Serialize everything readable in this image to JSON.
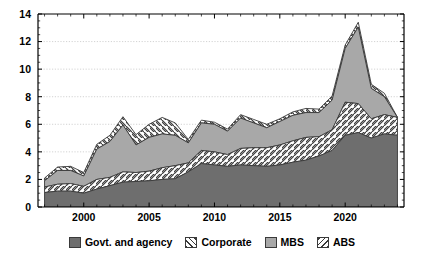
{
  "chart_data": {
    "type": "area",
    "stacked": true,
    "title": "",
    "subtitle": "",
    "xlabel": "",
    "ylabel": "",
    "xlim": [
      1996.5,
      2024.5
    ],
    "ylim": [
      0,
      14
    ],
    "yticks": [
      0,
      2,
      4,
      6,
      8,
      10,
      12,
      14
    ],
    "ytick_labels": [
      "0",
      "2",
      "4",
      "6",
      "8",
      "10",
      "12",
      "14"
    ],
    "xticks": [
      2000,
      2005,
      2010,
      2015,
      2020
    ],
    "xtick_labels": [
      "2000",
      "2005",
      "2010",
      "2015",
      "2020"
    ],
    "minor_xtick_interval": 1,
    "grid": "horizontal-dotted",
    "legend_position": "bottom-center",
    "x": [
      1997,
      1998,
      1999,
      2000,
      2001,
      2002,
      2003,
      2004,
      2005,
      2006,
      2007,
      2008,
      2009,
      2010,
      2011,
      2012,
      2013,
      2014,
      2015,
      2016,
      2017,
      2018,
      2019,
      2020,
      2021,
      2022,
      2023,
      2024
    ],
    "series": [
      {
        "name": "Govt. and agency",
        "key": "govt",
        "color": "#6e6e6e",
        "pattern": "solid",
        "values": [
          1.05,
          1.15,
          1.15,
          1.0,
          1.3,
          1.55,
          1.8,
          1.85,
          1.9,
          2.0,
          2.05,
          2.55,
          3.15,
          3.05,
          2.95,
          3.05,
          3.0,
          2.95,
          3.05,
          3.25,
          3.4,
          3.7,
          4.1,
          5.2,
          5.4,
          5.0,
          5.3,
          5.2
        ]
      },
      {
        "name": "Corporate",
        "key": "corporate",
        "color": "#ffffff",
        "pattern": "hatch-forward",
        "values": [
          0.4,
          0.5,
          0.55,
          0.5,
          0.7,
          0.6,
          0.75,
          0.65,
          0.7,
          0.85,
          0.95,
          0.65,
          0.95,
          0.95,
          0.85,
          1.2,
          1.3,
          1.35,
          1.45,
          1.55,
          1.65,
          1.4,
          1.5,
          2.4,
          2.1,
          1.4,
          1.4,
          1.3
        ]
      },
      {
        "name": "MBS",
        "key": "mbs",
        "color": "#a8a8a8",
        "pattern": "solid",
        "values": [
          0.45,
          1.0,
          0.95,
          0.75,
          2.2,
          2.6,
          3.4,
          2.0,
          2.45,
          2.45,
          2.2,
          1.45,
          2.0,
          2.0,
          1.7,
          2.2,
          1.8,
          1.45,
          1.7,
          1.85,
          1.8,
          1.75,
          2.15,
          3.9,
          5.55,
          2.2,
          1.3,
          0.0
        ]
      },
      {
        "name": "ABS",
        "key": "abs",
        "color": "#ffffff",
        "pattern": "hatch-back",
        "values": [
          0.2,
          0.25,
          0.3,
          0.25,
          0.35,
          0.45,
          0.6,
          0.75,
          0.95,
          1.2,
          0.9,
          0.25,
          0.2,
          0.15,
          0.15,
          0.25,
          0.25,
          0.25,
          0.2,
          0.25,
          0.3,
          0.25,
          0.3,
          0.25,
          0.35,
          0.3,
          0.25,
          0.0
        ]
      }
    ]
  },
  "legend": {
    "items": [
      {
        "label": "Govt. and agency",
        "color": "#6e6e6e",
        "pattern": "solid"
      },
      {
        "label": "Corporate",
        "color": "#ffffff",
        "pattern": "hatch-forward"
      },
      {
        "label": "MBS",
        "color": "#a8a8a8",
        "pattern": "solid"
      },
      {
        "label": "ABS",
        "color": "#ffffff",
        "pattern": "hatch-back"
      }
    ]
  },
  "axes": {
    "y_label_0": "0",
    "y_label_2": "2",
    "y_label_4": "4",
    "y_label_6": "6",
    "y_label_8": "8",
    "y_label_10": "10",
    "y_label_12": "12",
    "y_label_14": "14",
    "x_label_2000": "2000",
    "x_label_2005": "2005",
    "x_label_2010": "2010",
    "x_label_2015": "2015",
    "x_label_2020": "2020"
  },
  "colors": {
    "axis": "#000000",
    "grid": "#c8c8c8",
    "outline": "#3a3a3a",
    "background": "#ffffff"
  }
}
